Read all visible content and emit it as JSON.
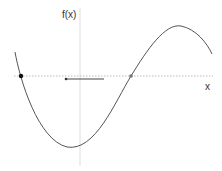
{
  "diagram": {
    "type": "function-plot",
    "y_axis_label": "f(x)",
    "x_axis_label": "x",
    "colors": {
      "curve": "#555555",
      "x_axis": "#bbbbbb",
      "y_axis": "#dddddd",
      "root_left": "#111111",
      "root_middle": "#777777",
      "arrow": "#444444"
    },
    "points": [
      {
        "name": "left-root",
        "style": "filled-black"
      },
      {
        "name": "middle-root",
        "style": "filled-gray"
      }
    ],
    "arrow": {
      "direction": "left"
    }
  }
}
